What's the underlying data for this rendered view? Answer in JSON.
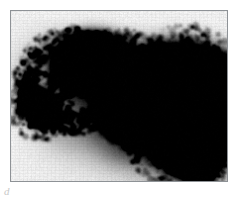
{
  "figure": {
    "label": "d",
    "modality": "nuclear-medicine-scintigraphy",
    "study": "Liver-spleen colloid scan",
    "view": "anterior",
    "frame": {
      "x": 10,
      "y": 10,
      "width": 218,
      "height": 172,
      "border_color": "#8e9296",
      "background_color": "#fbfbfb"
    },
    "page_background": "#ffffff",
    "activity_color": "#000000"
  },
  "chart_data": {
    "type": "heatmap",
    "title": "",
    "subtitle": "",
    "xlabel": "",
    "ylabel": "",
    "grid": false,
    "legend_position": "none",
    "colormap": "grayscale-inverted",
    "xlim": [
      0,
      218
    ],
    "ylim": [
      0,
      172
    ],
    "background_level": 0.04,
    "annotations": [
      {
        "text": "d",
        "x": 4,
        "y": 185
      }
    ],
    "regions": [
      {
        "name": "spleen",
        "label": "Upper-left focal uptake (spleen)",
        "intensity": 1.0,
        "cx": 80,
        "cy": 52,
        "rx": 33,
        "ry": 26,
        "rotation": -12,
        "blur": 7,
        "shape": "ellipse"
      },
      {
        "name": "accessory-focus",
        "label": "Small lower-left focal uptake",
        "intensity": 1.0,
        "cx": 27,
        "cy": 95,
        "rx": 14,
        "ry": 16,
        "rotation": -25,
        "blur": 6,
        "shape": "ellipse"
      },
      {
        "name": "liver",
        "label": "Large right-sided uptake (liver)",
        "intensity": 1.0,
        "cx": 175,
        "cy": 100,
        "rx": 45,
        "ry": 62,
        "rotation": 0,
        "blur": 8,
        "shape": "liver-polygon"
      },
      {
        "name": "marrow-diffuse",
        "label": "Central diffuse speckled uptake (marrow / spine)",
        "intensity": 0.45,
        "cx": 120,
        "cy": 88,
        "rx": 46,
        "ry": 52,
        "rotation": 0,
        "blur": 9,
        "shape": "speckle-field"
      },
      {
        "name": "left-halo",
        "label": "Faint halo left of spleen",
        "intensity": 0.22,
        "cx": 44,
        "cy": 70,
        "rx": 30,
        "ry": 30,
        "rotation": 0,
        "blur": 12,
        "shape": "ellipse"
      }
    ],
    "profile_notes": "Anterior planar image. Two discrete high-count foci left of midline, one broad lobulated high-count mass right of midline tapering to an inferior tip, with a lower-count granular band between them."
  }
}
